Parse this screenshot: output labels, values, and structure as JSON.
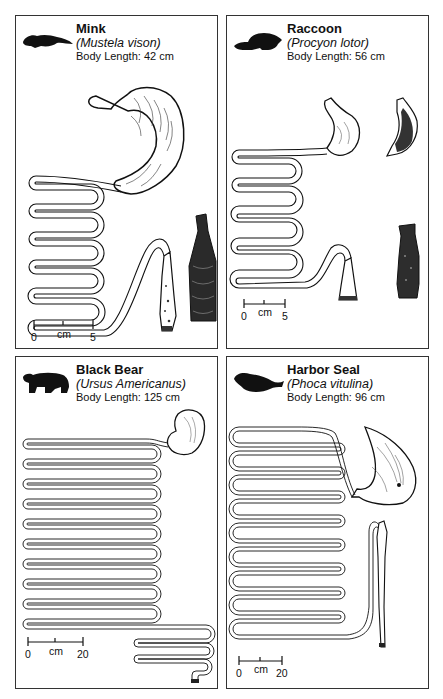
{
  "figure": {
    "panels": [
      {
        "id": "mink",
        "common_name": "Mink",
        "scientific_name": "(Mustela vison)",
        "body_length_label": "Body Length: 42 cm",
        "body_length_cm": 42,
        "scale": {
          "min": "0",
          "unit": "cm",
          "max": "5"
        },
        "silhouette": "mink-silhouette-icon",
        "parts": [
          "stomach",
          "small-intestine",
          "cecum",
          "large-intestine"
        ]
      },
      {
        "id": "raccoon",
        "common_name": "Raccoon",
        "scientific_name": "(Procyon lotor)",
        "body_length_label": "Body Length: 56 cm",
        "body_length_cm": 56,
        "scale": {
          "min": "0",
          "unit": "cm",
          "max": "5"
        },
        "silhouette": "raccoon-silhouette-icon",
        "parts": [
          "stomach",
          "stomach-interior",
          "small-intestine",
          "colon",
          "large-intestine-interior"
        ]
      },
      {
        "id": "black-bear",
        "common_name": "Black Bear",
        "scientific_name": "(Ursus Americanus)",
        "body_length_label": "Body Length: 125 cm",
        "body_length_cm": 125,
        "scale": {
          "min": "0",
          "unit": "cm",
          "max": "20"
        },
        "silhouette": "bear-silhouette-icon",
        "parts": [
          "stomach",
          "small-intestine",
          "large-intestine"
        ]
      },
      {
        "id": "harbor-seal",
        "common_name": "Harbor Seal",
        "scientific_name": "(Phoca vitulina)",
        "body_length_label": "Body Length: 96 cm",
        "body_length_cm": 96,
        "scale": {
          "min": "0",
          "unit": "cm",
          "max": "20"
        },
        "silhouette": "seal-silhouette-icon",
        "parts": [
          "stomach",
          "small-intestine",
          "large-intestine"
        ]
      }
    ]
  }
}
